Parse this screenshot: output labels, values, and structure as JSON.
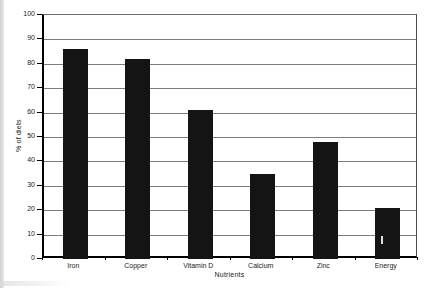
{
  "chart_data": {
    "type": "bar",
    "categories": [
      "Iron",
      "Copper",
      "Vitamin D",
      "Calcium",
      "Zinc",
      "Energy"
    ],
    "values": [
      86,
      82,
      61,
      35,
      48,
      21
    ],
    "title": "",
    "xlabel": "Nutrients",
    "ylabel": "% of diets",
    "ylim": [
      0,
      100
    ],
    "yticks": [
      0,
      10,
      20,
      30,
      40,
      50,
      60,
      70,
      80,
      90,
      100
    ],
    "grid": true,
    "legend_position": "none",
    "bar_color": "#141414",
    "gridline_color": "#7d7d7d",
    "axis_color": "#000000",
    "text_color": "#222222"
  }
}
